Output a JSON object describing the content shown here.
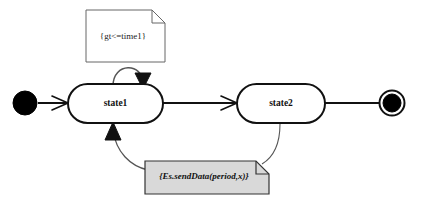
{
  "diagram": {
    "type": "uml-state-machine",
    "title": "",
    "background_color": "#ffffff",
    "line_color": "#111111",
    "states": [
      {
        "id": "state1",
        "label": "state1",
        "shape": "rounded-rectangle",
        "fill": "#ffffff",
        "stroke": "#111111"
      },
      {
        "id": "state2",
        "label": "state2",
        "shape": "rounded-rectangle",
        "fill": "#ffffff",
        "stroke": "#111111"
      }
    ],
    "pseudostates": [
      {
        "id": "initial",
        "kind": "initial",
        "label": "",
        "fill": "#000000"
      },
      {
        "id": "final",
        "kind": "final",
        "label": "",
        "fill": "#000000",
        "ring_stroke": "#111111"
      }
    ],
    "transitions": [
      {
        "id": "initial-to-state1",
        "from": "initial",
        "to": "state1",
        "label": "",
        "arrowhead": "open"
      },
      {
        "id": "state1-self-loop",
        "from": "state1",
        "to": "state1",
        "label": "",
        "arrowhead": "filled"
      },
      {
        "id": "state1-to-state2",
        "from": "state1",
        "to": "state2",
        "label": "",
        "arrowhead": "open"
      },
      {
        "id": "state2-to-final",
        "from": "state2",
        "to": "final",
        "label": "",
        "arrowhead": "none"
      },
      {
        "id": "return-to-state1",
        "from": "state2",
        "to": "state1",
        "label": "",
        "arrowhead": "filled"
      }
    ],
    "notes": [
      {
        "id": "guard-note",
        "text": "{gt<=time1}",
        "fill": "#ffffff",
        "stroke": "#555555",
        "style": "plain",
        "attached_to": "state1-self-loop"
      },
      {
        "id": "action-note",
        "text": "{Es.sendData(period,x)}",
        "fill": "#d9d9d9",
        "stroke": "#333333",
        "style": "italic-bold",
        "attached_to": "return-to-state1"
      }
    ]
  }
}
